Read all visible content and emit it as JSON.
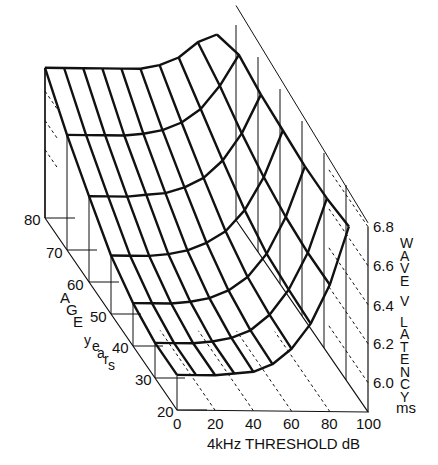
{
  "chart_data": {
    "type": "surface3d",
    "title": "",
    "x_axis": {
      "label": "4kHz THRESHOLD dB",
      "ticks": [
        0,
        20,
        40,
        60,
        80,
        100
      ],
      "range": [
        0,
        100
      ]
    },
    "y_axis": {
      "label": "AGE years",
      "ticks": [
        20,
        30,
        40,
        50,
        60,
        70,
        80
      ],
      "range": [
        20,
        80
      ]
    },
    "z_axis": {
      "label": "WAVE V LATENCY",
      "unit": "ms",
      "ticks": [
        "6.0",
        "6.2",
        "6.4",
        "6.6",
        "6.8"
      ],
      "range": [
        5.85,
        6.8
      ]
    },
    "threshold_grid": [
      0,
      10,
      20,
      30,
      40,
      50,
      60,
      70,
      80,
      90
    ],
    "ages": [
      20,
      30,
      40,
      50,
      60,
      70,
      80
    ],
    "latency_ms": [
      [
        6.03,
        6.03,
        6.03,
        6.04,
        6.05,
        6.09,
        6.17,
        6.3,
        6.5,
        6.8
      ],
      [
        6.03,
        6.03,
        6.03,
        6.04,
        6.06,
        6.1,
        6.18,
        6.31,
        6.5,
        6.78
      ],
      [
        6.07,
        6.07,
        6.07,
        6.08,
        6.1,
        6.14,
        6.21,
        6.33,
        6.52,
        6.78
      ],
      [
        6.15,
        6.15,
        6.15,
        6.16,
        6.18,
        6.22,
        6.28,
        6.39,
        6.56,
        6.8
      ],
      [
        6.29,
        6.29,
        6.29,
        6.3,
        6.31,
        6.34,
        6.39,
        6.48,
        6.62,
        6.82
      ],
      [
        6.44,
        6.44,
        6.44,
        6.44,
        6.45,
        6.47,
        6.51,
        6.58,
        6.7,
        6.86
      ],
      [
        6.62,
        6.62,
        6.62,
        6.62,
        6.62,
        6.62,
        6.64,
        6.68,
        6.76,
        6.8
      ]
    ]
  },
  "labels": {
    "x_title": "4kHz THRESHOLD dB",
    "x_ticks": [
      "0",
      "20",
      "40",
      "60",
      "80",
      "100"
    ],
    "age_ticks": [
      "20",
      "30",
      "40",
      "50",
      "60",
      "70",
      "80"
    ],
    "age_title_big": "AGE",
    "age_title_small": "years",
    "z_ticks": [
      "6.0",
      "6.2",
      "6.4",
      "6.6",
      "6.8"
    ],
    "z_title": "WAVE V LATENCY",
    "z_unit": "ms"
  }
}
